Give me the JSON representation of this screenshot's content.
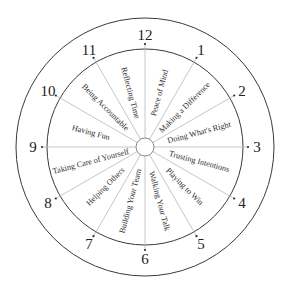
{
  "diagram": {
    "type": "clock-wheel",
    "center": [
      145,
      147
    ],
    "outer_radius": 129,
    "inner_radius": 98,
    "hub_radius": 9,
    "hours": [
      "12",
      "1",
      "2",
      "3",
      "4",
      "5",
      "6",
      "7",
      "8",
      "9",
      "10",
      "11"
    ],
    "segments": [
      {
        "between": [
          "12",
          "1"
        ],
        "label": "Peace of Mind"
      },
      {
        "between": [
          "1",
          "2"
        ],
        "label": "Making a Difference"
      },
      {
        "between": [
          "2",
          "3"
        ],
        "label": "Doing What's Right"
      },
      {
        "between": [
          "3",
          "4"
        ],
        "label": "Trusting Intentions"
      },
      {
        "between": [
          "4",
          "5"
        ],
        "label": "Playing to Win"
      },
      {
        "between": [
          "5",
          "6"
        ],
        "label": "Walking Your Talk"
      },
      {
        "between": [
          "6",
          "7"
        ],
        "label": "Building Your Team"
      },
      {
        "between": [
          "7",
          "8"
        ],
        "label": "Helping Others"
      },
      {
        "between": [
          "8",
          "9"
        ],
        "label": "Taking Care of Yourself"
      },
      {
        "between": [
          "9",
          "10"
        ],
        "label": "Having Fun"
      },
      {
        "between": [
          "10",
          "11"
        ],
        "label": "Being Accountable"
      },
      {
        "between": [
          "11",
          "12"
        ],
        "label": "Reflecting Time"
      }
    ]
  }
}
